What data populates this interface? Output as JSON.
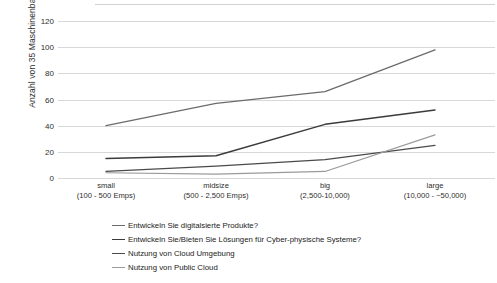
{
  "chart": {
    "type": "line",
    "title": "",
    "xlabel": "",
    "ylabel": "Anzahl von 35 Maschinenbau-Unternehmen"
  },
  "chart_data": {
    "type": "line",
    "title": "",
    "xlabel": "",
    "ylabel": "Anzahl von 35 Maschinenbau-Unternehmen",
    "ylim": [
      0,
      120
    ],
    "yticks": [
      0,
      20,
      40,
      60,
      80,
      100,
      120
    ],
    "grid": true,
    "legend_position": "bottom-left",
    "categories": [
      "small\n(100 - 500 Emps)",
      "midsize\n(500 - 2,500 Emps)",
      "big\n(2,500-10,000)",
      "large\n(10,000 - ~50,000)"
    ],
    "category_names": [
      "small",
      "midsize",
      "big",
      "large"
    ],
    "category_ranges": [
      "(100 - 500 Emps)",
      "(500 - 2,500 Emps)",
      "(2,500-10,000)",
      "(10,000 - ~50,000)"
    ],
    "series": [
      {
        "name": "Entwickeln Sie digitalsierte Produkte?",
        "color": "#6b6b6b",
        "width": 1.3,
        "values": [
          40,
          57,
          66,
          98
        ]
      },
      {
        "name": "Entwickeln Sie/Bieten Sie Lösungen für Cyber-physische Systeme?",
        "color": "#3b3b3b",
        "width": 1.5,
        "values": [
          15,
          17,
          41,
          52
        ]
      },
      {
        "name": "Nutzung von Cloud Umgebung",
        "color": "#4a4a4a",
        "width": 1.3,
        "values": [
          5,
          9,
          14,
          25
        ]
      },
      {
        "name": "Nutzung von Public Cloud",
        "color": "#9a9a9a",
        "width": 1.2,
        "values": [
          4,
          3,
          5,
          33
        ]
      }
    ]
  },
  "yticks": {
    "t0": "0",
    "t1": "20",
    "t2": "40",
    "t3": "60",
    "t4": "80",
    "t5": "100",
    "t6": "120"
  },
  "xaxis": {
    "cat0_name": "small",
    "cat0_range": "(100 - 500 Emps)",
    "cat1_name": "midsize",
    "cat1_range": "(500 - 2,500 Emps)",
    "cat2_name": "big",
    "cat2_range": "(2,500-10,000)",
    "cat3_name": "large",
    "cat3_range": "(10,000 - ~50,000)"
  },
  "legend": {
    "items": [
      {
        "label": "Entwickeln Sie digitalsierte Produkte?",
        "color": "#6b6b6b"
      },
      {
        "label": "Entwickeln Sie/Bieten Sie Lösungen für Cyber-physische Systeme?",
        "color": "#3b3b3b"
      },
      {
        "label": "Nutzung von Cloud Umgebung",
        "color": "#4a4a4a"
      },
      {
        "label": "Nutzung von Public Cloud",
        "color": "#9a9a9a"
      }
    ]
  }
}
